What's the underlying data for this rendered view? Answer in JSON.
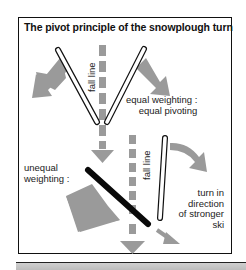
{
  "diagram": {
    "title": "The pivot principle of the snowplough turn",
    "top_panel": {
      "fall_line_label": "fall line",
      "caption_line1": "equal weighting :",
      "caption_line2": "equal pivoting"
    },
    "bottom_panel": {
      "left_caption_line1": "unequal",
      "left_caption_line2": "weighting :",
      "fall_line_label": "fall line",
      "right_caption_line1": "turn in",
      "right_caption_line2": "direction",
      "right_caption_line3": "of stronger",
      "right_caption_line4": "ski"
    },
    "colors": {
      "arrow_gray": "#9a9a9a",
      "ski_outline": "#111111",
      "weighted_ski": "#0a0a0a",
      "frame": "#111111"
    }
  }
}
